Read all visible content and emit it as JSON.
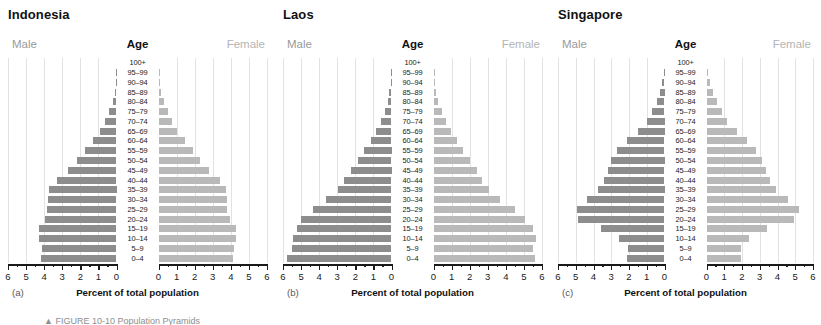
{
  "figure": {
    "caption_partial": "▲ FIGURE 10-10 Population Pyramids"
  },
  "labels": {
    "male": "Male",
    "female": "Female",
    "age": "Age",
    "axis_title": "Percent of total population"
  },
  "axis": {
    "ticks": [
      "6",
      "5",
      "4",
      "3",
      "2",
      "1",
      "0",
      "0",
      "1",
      "2",
      "3",
      "4",
      "5",
      "6"
    ],
    "max": 6,
    "minor_per_major": 2
  },
  "colors": {
    "male_bar": "#8d8d8d",
    "female_bar": "#b9b9b9",
    "gridline": "#e2e2e2",
    "axis": "#1a1a1a",
    "male_header": "#9a9a9a",
    "female_header": "#b4b4b4"
  },
  "age_groups": [
    "100+",
    "95–99",
    "90–94",
    "85–89",
    "80–84",
    "75–79",
    "70–74",
    "65–69",
    "60–64",
    "55–59",
    "50–54",
    "45–49",
    "40–44",
    "35–39",
    "30–34",
    "25–29",
    "20–24",
    "15–19",
    "10–14",
    "5–9",
    "0–4"
  ],
  "panels": [
    {
      "letter": "(a)",
      "country": "Indonesia"
    },
    {
      "letter": "(b)",
      "country": "Laos"
    },
    {
      "letter": "(c)",
      "country": "Singapore"
    }
  ],
  "chart_data": [
    {
      "type": "bar",
      "title": "Indonesia",
      "subtitle": "(a)",
      "xlabel": "Percent of total population",
      "ylabel": "Age",
      "orientation": "population-pyramid",
      "xlim": [
        0,
        6
      ],
      "grid": true,
      "legend_position": "top",
      "categories": [
        "100+",
        "95–99",
        "90–94",
        "85–89",
        "80–84",
        "75–79",
        "70–74",
        "65–69",
        "60–64",
        "55–59",
        "50–54",
        "45–49",
        "40–44",
        "35–39",
        "30–34",
        "25–29",
        "20–24",
        "15–19",
        "10–14",
        "5–9",
        "0–4"
      ],
      "series": [
        {
          "name": "Male",
          "side": "left",
          "values": [
            0.0,
            0.02,
            0.05,
            0.1,
            0.22,
            0.4,
            0.62,
            0.9,
            1.3,
            1.75,
            2.2,
            2.7,
            3.3,
            3.75,
            3.8,
            3.85,
            3.95,
            4.3,
            4.3,
            4.1,
            4.15
          ]
        },
        {
          "name": "Female",
          "side": "right",
          "values": [
            0.0,
            0.03,
            0.07,
            0.14,
            0.28,
            0.5,
            0.75,
            1.0,
            1.45,
            1.9,
            2.3,
            2.8,
            3.4,
            3.75,
            3.8,
            3.8,
            3.95,
            4.3,
            4.3,
            4.15,
            4.1
          ]
        }
      ]
    },
    {
      "type": "bar",
      "title": "Laos",
      "subtitle": "(b)",
      "xlabel": "Percent of total population",
      "ylabel": "Age",
      "orientation": "population-pyramid",
      "xlim": [
        0,
        6
      ],
      "grid": true,
      "legend_position": "top",
      "categories": [
        "100+",
        "95–99",
        "90–94",
        "85–89",
        "80–84",
        "75–79",
        "70–74",
        "65–69",
        "60–64",
        "55–59",
        "50–54",
        "45–49",
        "40–44",
        "35–39",
        "30–34",
        "25–29",
        "20–24",
        "15–19",
        "10–14",
        "5–9",
        "0–4"
      ],
      "series": [
        {
          "name": "Male",
          "side": "left",
          "values": [
            0.0,
            0.02,
            0.05,
            0.12,
            0.22,
            0.38,
            0.6,
            0.85,
            1.15,
            1.5,
            1.85,
            2.25,
            2.6,
            2.95,
            3.6,
            4.35,
            5.0,
            5.2,
            5.45,
            5.5,
            5.8
          ]
        },
        {
          "name": "Female",
          "side": "right",
          "values": [
            0.0,
            0.03,
            0.06,
            0.14,
            0.26,
            0.45,
            0.68,
            0.95,
            1.3,
            1.65,
            2.0,
            2.4,
            2.7,
            3.05,
            3.7,
            4.5,
            5.05,
            5.5,
            5.65,
            5.5,
            5.6
          ]
        }
      ]
    },
    {
      "type": "bar",
      "title": "Singapore",
      "subtitle": "(c)",
      "xlabel": "Percent of total population",
      "ylabel": "Age",
      "orientation": "population-pyramid",
      "xlim": [
        0,
        6
      ],
      "grid": true,
      "legend_position": "top",
      "categories": [
        "100+",
        "95–99",
        "90–94",
        "85–89",
        "80–84",
        "75–79",
        "70–74",
        "65–69",
        "60–64",
        "55–59",
        "50–54",
        "45–49",
        "40–44",
        "35–39",
        "30–34",
        "25–29",
        "20–24",
        "15–19",
        "10–14",
        "5–9",
        "0–4"
      ],
      "series": [
        {
          "name": "Male",
          "side": "left",
          "values": [
            0.0,
            0.05,
            0.12,
            0.25,
            0.45,
            0.72,
            1.0,
            1.5,
            2.1,
            2.65,
            3.0,
            3.2,
            3.4,
            3.75,
            4.35,
            4.95,
            4.9,
            3.55,
            2.55,
            2.05,
            2.1
          ]
        },
        {
          "name": "Female",
          "side": "right",
          "values": [
            0.0,
            0.08,
            0.18,
            0.35,
            0.6,
            0.85,
            1.15,
            1.7,
            2.3,
            2.8,
            3.15,
            3.35,
            3.55,
            3.9,
            4.6,
            5.2,
            4.95,
            3.4,
            2.4,
            1.95,
            1.95
          ]
        }
      ]
    }
  ]
}
